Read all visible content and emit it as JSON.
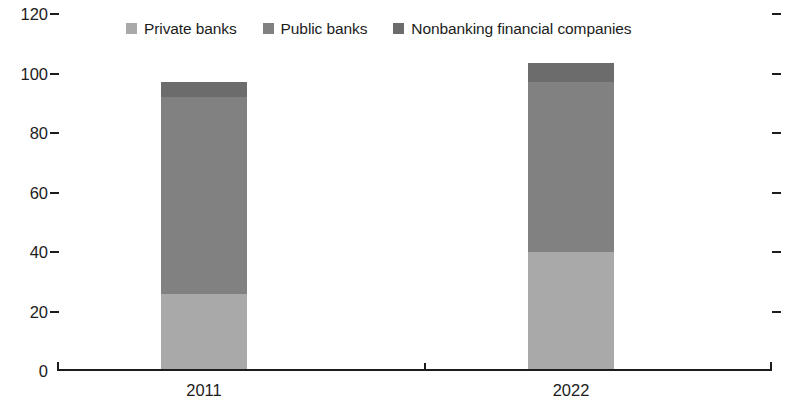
{
  "chart_data": {
    "type": "bar",
    "subtype": "stacked-bar",
    "title": "",
    "subtitle": "",
    "xlabel": "",
    "ylabel": "",
    "categories": [
      "2011",
      "2022"
    ],
    "series": [
      {
        "name": "Private banks",
        "values": [
          26,
          40
        ],
        "color": "#a9a9a9"
      },
      {
        "name": "Public banks",
        "values": [
          66,
          57
        ],
        "color": "#818181"
      },
      {
        "name": "Nonbanking financial companies",
        "values": [
          5,
          6.5
        ],
        "color": "#6c6c6c"
      }
    ],
    "totals": [
      97,
      103.5
    ],
    "ylim": [
      0,
      120
    ],
    "yticks": [
      0,
      20,
      40,
      60,
      80,
      100,
      120
    ],
    "ytick_labels": [
      "0",
      "20",
      "40",
      "60",
      "80",
      "100",
      "120"
    ],
    "right_axis_ticks": [
      20,
      40,
      60,
      80,
      100,
      120
    ],
    "grid": false,
    "legend_position": "top-center",
    "legend": [
      {
        "label": "Private banks",
        "swatch_color": "#a9a9a9"
      },
      {
        "label": "Public banks",
        "swatch_color": "#818181"
      },
      {
        "label": "Nonbanking financial companies",
        "swatch_color": "#6c6c6c"
      }
    ]
  },
  "axis": {
    "y_labels": [
      "120",
      "100",
      "80",
      "60",
      "40",
      "20",
      "0"
    ],
    "x_labels": [
      "2011",
      "2022"
    ]
  },
  "colors": {
    "axis": "#1c1c1c",
    "text": "#1c1c1c",
    "background": "#ffffff",
    "private_banks": "#a9a9a9",
    "public_banks": "#818181",
    "nonbanking": "#6c6c6c"
  }
}
